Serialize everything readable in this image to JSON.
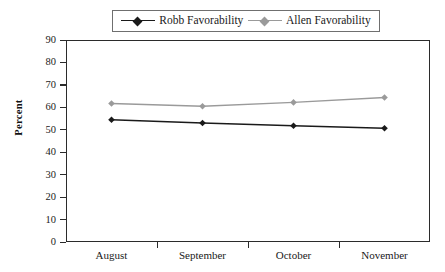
{
  "chart_data": {
    "type": "line",
    "title": "",
    "xlabel": "",
    "ylabel": "Percent",
    "categories": [
      "August",
      "September",
      "October",
      "November"
    ],
    "ylim": [
      0,
      90
    ],
    "yticks": [
      0,
      10,
      20,
      30,
      40,
      50,
      60,
      70,
      80,
      90
    ],
    "grid": false,
    "legend_position": "top",
    "series": [
      {
        "name": "Robb Favorability",
        "values": [
          54.5,
          53.0,
          51.8,
          50.7
        ],
        "color": "#1a1a1a",
        "marker": "diamond"
      },
      {
        "name": "Allen Favorability",
        "values": [
          61.7,
          60.5,
          62.2,
          64.4
        ],
        "color": "#9a9a9a",
        "marker": "diamond"
      }
    ]
  },
  "legend": {
    "entries": [
      {
        "label": "Robb Favorability",
        "color": "#1a1a1a"
      },
      {
        "label": "Allen Favorability",
        "color": "#9a9a9a"
      }
    ]
  },
  "axes": {
    "y_title": "Percent",
    "y_tick_labels": [
      "90",
      "80",
      "70",
      "60",
      "50",
      "40",
      "30",
      "20",
      "10",
      "0"
    ],
    "x_tick_labels": [
      "August",
      "September",
      "October",
      "November"
    ]
  },
  "colors": {
    "series_robb": "#1a1a1a",
    "series_allen": "#9a9a9a",
    "axis": "#2b2b2b",
    "background": "#ffffff"
  }
}
